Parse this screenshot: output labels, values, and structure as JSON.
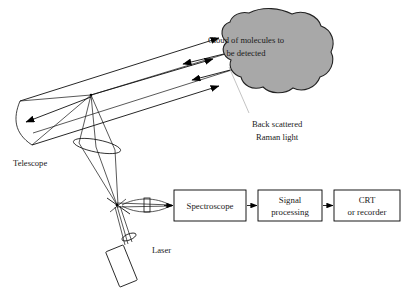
{
  "figure": {
    "background_color": "#ffffff",
    "line_color": "#000000",
    "cloud_fill_color": "#a8a8a8",
    "cloud_stroke_color": "#222222",
    "leader_color": "#b4b4b4"
  },
  "labels": {
    "cloud_line1": "Cloud of molecules to",
    "cloud_line2": "be detected",
    "backscatter_line1": "Back scattered",
    "backscatter_line2": "Raman light",
    "telescope": "Telescope",
    "laser": "Laser"
  },
  "boxes": [
    {
      "id": "spectroscope",
      "line1": "Spectroscope",
      "line2": ""
    },
    {
      "id": "signal-processing",
      "line1": "Signal",
      "line2": "processing"
    },
    {
      "id": "crt-recorder",
      "line1": "CRT",
      "line2": "or recorder"
    }
  ],
  "components": [
    {
      "name": "telescope-mirror",
      "type": "concave-mirror"
    },
    {
      "name": "secondary-mirror-node",
      "type": "node"
    },
    {
      "name": "collecting-lens",
      "type": "lens-ellipse"
    },
    {
      "name": "beam-splitter",
      "type": "crossing-node"
    },
    {
      "name": "coupling-lens",
      "type": "lens"
    },
    {
      "name": "aperture-stop",
      "type": "rectangle"
    },
    {
      "name": "laser-head",
      "type": "rectangle"
    },
    {
      "name": "laser-output-lens",
      "type": "lens"
    }
  ],
  "beams": {
    "outgoing_count": 3,
    "returning_count": 2,
    "outgoing_direction": "right",
    "returning_direction": "left"
  }
}
